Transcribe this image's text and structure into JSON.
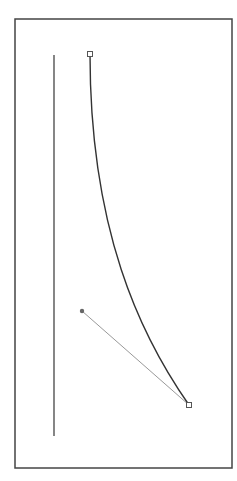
{
  "canvas": {
    "width": 237,
    "height": 481,
    "background": "#ffffff"
  },
  "frame": {
    "x1": 15,
    "y1": 19,
    "x2": 232,
    "y2": 468,
    "color": "#444444"
  },
  "guide_line": {
    "x": 54,
    "y1": 55,
    "y2": 436,
    "color": "#444444"
  },
  "curve": {
    "path": "M90,54 C90,230 140,335 189,405",
    "color": "#333333"
  },
  "start_anchor": {
    "x": 90,
    "y": 54
  },
  "end_anchor": {
    "x": 189,
    "y": 405
  },
  "handle": {
    "x": 82,
    "y": 311,
    "line_color": "#999999",
    "dot_color": "#666666"
  }
}
